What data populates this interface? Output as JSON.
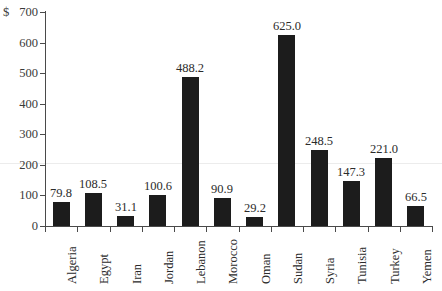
{
  "chart_data": {
    "type": "bar",
    "title": "",
    "subtitle": "",
    "xlabel": "",
    "ylabel": "$",
    "ylim": [
      0,
      700
    ],
    "ytick_step": 100,
    "yticks": [
      0,
      100,
      200,
      300,
      400,
      500,
      600,
      700
    ],
    "ytick_labels": [
      "0",
      "100",
      "200",
      "300",
      "400",
      "500",
      "600",
      "700"
    ],
    "currency_symbol": "$",
    "grid": false,
    "legend": null,
    "bar_color": "#1c1c1c",
    "axis_color": "#4a4a4a",
    "categories": [
      "Algeria",
      "Egypt",
      "Iran",
      "Jordan",
      "Lebanon",
      "Morocco",
      "Oman",
      "Sudan",
      "Syria",
      "Tunisia",
      "Turkey",
      "Yemen"
    ],
    "values": [
      79.8,
      108.5,
      31.1,
      100.6,
      488.2,
      90.9,
      29.2,
      625.0,
      248.5,
      147.3,
      221.0,
      66.5
    ],
    "value_labels": [
      "79.8",
      "108.5",
      "31.1",
      "100.6",
      "488.2",
      "90.9",
      "29.2",
      "625.0",
      "248.5",
      "147.3",
      "221.0",
      "66.5"
    ]
  }
}
